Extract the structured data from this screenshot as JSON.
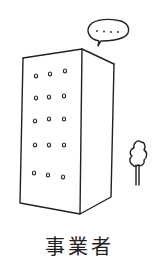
{
  "illustration": {
    "subject": "building",
    "caption": "事業者",
    "speech_bubble": {
      "text": "...."
    },
    "window_rows": 5,
    "window_cols": 3,
    "colors": {
      "ink": "#222222",
      "background": "#ffffff"
    }
  }
}
